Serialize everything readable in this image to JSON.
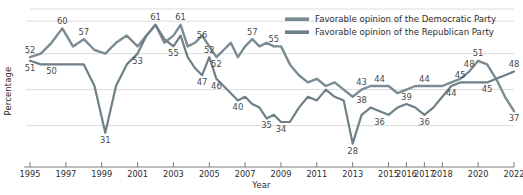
{
  "chart_data": {
    "type": "line",
    "title": "",
    "xlabel": "Year",
    "ylabel": "Percentage",
    "grid": true,
    "legend_position": "top-right",
    "xlim": [
      1995,
      2022
    ],
    "ylim": [
      24,
      64
    ],
    "xticks": [
      1995,
      1997,
      1999,
      2001,
      2003,
      2005,
      2007,
      2009,
      2011,
      2013,
      2015,
      2016,
      2017,
      2018,
      2020,
      2022
    ],
    "xtick_labels": [
      "1995",
      "1997",
      "1999",
      "2001",
      "2003",
      "2005",
      "2007",
      "2009",
      "2011",
      "2013",
      "2015",
      "2016",
      "2017",
      "2018",
      "2020",
      "2022"
    ],
    "yticks": [],
    "ytick_labels": [],
    "series": [
      {
        "name": "Favorable opinion of the Democratic Party",
        "color": "#7a8b94",
        "x": [
          1995.0,
          1995.6,
          1996.2,
          1996.8,
          1997.4,
          1998.0,
          1998.6,
          1999.2,
          1999.8,
          2000.4,
          2001.0,
          2001.5,
          2002.0,
          2002.5,
          2003.0,
          2003.4,
          2003.8,
          2004.2,
          2004.6,
          2005.0,
          2005.4,
          2005.8,
          2006.2,
          2006.6,
          2007.0,
          2007.4,
          2007.8,
          2008.2,
          2008.6,
          2009.0,
          2009.5,
          2010.0,
          2010.5,
          2011.0,
          2011.5,
          2012.0,
          2012.5,
          2013.0,
          2013.5,
          2014.0,
          2014.5,
          2015.0,
          2015.5,
          2016.0,
          2016.5,
          2017.0,
          2017.5,
          2018.0,
          2018.5,
          2019.0,
          2019.5,
          2020.0,
          2020.5,
          2021.0,
          2021.5,
          2022.0
        ],
        "values": [
          52,
          53,
          56,
          60,
          55,
          57,
          54,
          53,
          56,
          58,
          55,
          58,
          61,
          56,
          58,
          61,
          55,
          56,
          58,
          55,
          52,
          54,
          56,
          52,
          55,
          57,
          55,
          56,
          55,
          55,
          50,
          47,
          45,
          46,
          44,
          45,
          43,
          41,
          43,
          44,
          44,
          44,
          42,
          43,
          44,
          44,
          44,
          44,
          45,
          46,
          48,
          51,
          50,
          46,
          41,
          37
        ],
        "point_labels": [
          {
            "x": 1995.0,
            "y": 52,
            "text": "52",
            "pos": "above"
          },
          {
            "x": 1996.8,
            "y": 60,
            "text": "60",
            "pos": "above"
          },
          {
            "x": 1998.0,
            "y": 57,
            "text": "57",
            "pos": "above"
          },
          {
            "x": 2002.0,
            "y": 61,
            "text": "61",
            "pos": "above"
          },
          {
            "x": 2003.4,
            "y": 61,
            "text": "61",
            "pos": "above"
          },
          {
            "x": 2004.6,
            "y": 56,
            "text": "56",
            "pos": "above"
          },
          {
            "x": 2005.4,
            "y": 52,
            "text": "52",
            "pos": "below"
          },
          {
            "x": 2007.4,
            "y": 57,
            "text": "57",
            "pos": "above"
          },
          {
            "x": 2008.6,
            "y": 55,
            "text": "55",
            "pos": "above"
          },
          {
            "x": 2013.5,
            "y": 43,
            "text": "43",
            "pos": "above"
          },
          {
            "x": 2014.5,
            "y": 44,
            "text": "44",
            "pos": "above"
          },
          {
            "x": 2017.0,
            "y": 44,
            "text": "44",
            "pos": "above"
          },
          {
            "x": 2019.5,
            "y": 48,
            "text": "48",
            "pos": "above"
          },
          {
            "x": 2020.0,
            "y": 51,
            "text": "51",
            "pos": "above"
          },
          {
            "x": 2022.0,
            "y": 37,
            "text": "37",
            "pos": "below"
          }
        ]
      },
      {
        "name": "Favorable opinion of the Republican Party",
        "color": "#6e7f88",
        "x": [
          1995.0,
          1995.6,
          1996.2,
          1996.8,
          1997.4,
          1998.0,
          1998.6,
          1999.2,
          1999.8,
          2000.4,
          2001.0,
          2001.5,
          2002.0,
          2002.5,
          2003.0,
          2003.4,
          2003.8,
          2004.2,
          2004.6,
          2005.0,
          2005.4,
          2005.8,
          2006.2,
          2006.6,
          2007.0,
          2007.4,
          2007.8,
          2008.2,
          2008.6,
          2009.0,
          2009.5,
          2010.0,
          2010.5,
          2011.0,
          2011.5,
          2012.0,
          2012.5,
          2013.0,
          2013.5,
          2014.0,
          2014.5,
          2015.0,
          2015.5,
          2016.0,
          2016.5,
          2017.0,
          2017.5,
          2018.0,
          2018.5,
          2019.0,
          2019.5,
          2020.0,
          2020.5,
          2021.0,
          2021.5,
          2022.0
        ],
        "values": [
          51,
          50,
          50,
          50,
          50,
          50,
          44,
          31,
          44,
          50,
          53,
          58,
          61,
          57,
          55,
          58,
          52,
          49,
          47,
          52,
          46,
          44,
          42,
          40,
          41,
          39,
          38,
          35,
          36,
          34,
          34,
          38,
          41,
          40,
          43,
          41,
          40,
          28,
          36,
          38,
          37,
          36,
          38,
          39,
          38,
          36,
          38,
          41,
          44,
          45,
          45,
          45,
          45,
          46,
          47,
          48
        ],
        "point_labels": [
          {
            "x": 1995.0,
            "y": 51,
            "text": "51",
            "pos": "below"
          },
          {
            "x": 1996.2,
            "y": 50,
            "text": "50",
            "pos": "below"
          },
          {
            "x": 1999.2,
            "y": 31,
            "text": "31",
            "pos": "below"
          },
          {
            "x": 2001.0,
            "y": 53,
            "text": "53",
            "pos": "below"
          },
          {
            "x": 2003.0,
            "y": 55,
            "text": "55",
            "pos": "below"
          },
          {
            "x": 2004.6,
            "y": 47,
            "text": "47",
            "pos": "below"
          },
          {
            "x": 2005.0,
            "y": 52,
            "text": "52",
            "pos": "above"
          },
          {
            "x": 2005.4,
            "y": 46,
            "text": "46",
            "pos": "below"
          },
          {
            "x": 2006.6,
            "y": 40,
            "text": "40",
            "pos": "below"
          },
          {
            "x": 2008.2,
            "y": 35,
            "text": "35",
            "pos": "below"
          },
          {
            "x": 2009.0,
            "y": 34,
            "text": "34",
            "pos": "below"
          },
          {
            "x": 2013.0,
            "y": 28,
            "text": "28",
            "pos": "below"
          },
          {
            "x": 2013.5,
            "y": 38,
            "text": "38",
            "pos": "above"
          },
          {
            "x": 2014.5,
            "y": 36,
            "text": "36",
            "pos": "below"
          },
          {
            "x": 2016.0,
            "y": 39,
            "text": "39",
            "pos": "above"
          },
          {
            "x": 2017.0,
            "y": 36,
            "text": "36",
            "pos": "below"
          },
          {
            "x": 2018.5,
            "y": 44,
            "text": "44",
            "pos": "below"
          },
          {
            "x": 2019.0,
            "y": 45,
            "text": "45",
            "pos": "above"
          },
          {
            "x": 2020.5,
            "y": 45,
            "text": "45",
            "pos": "below"
          },
          {
            "x": 2022.0,
            "y": 48,
            "text": "48",
            "pos": "above"
          }
        ]
      }
    ]
  },
  "legend": {
    "items": [
      {
        "label": "Favorable opinion of the Democratic Party",
        "color": "#7a8b94"
      },
      {
        "label": "Favorable opinion of the Republican Party",
        "color": "#6e7f88"
      }
    ]
  },
  "axes": {
    "x_title": "Year",
    "y_title": "Percentage"
  }
}
